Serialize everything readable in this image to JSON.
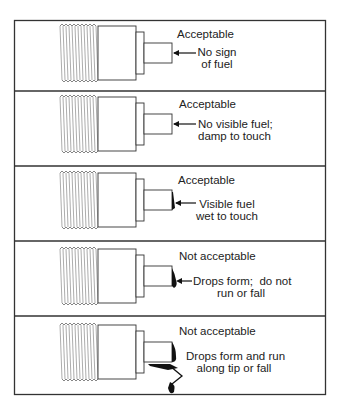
{
  "figure": {
    "panels": [
      {
        "status": "Acceptable",
        "description_lines": [
          "No sign",
          "of fuel"
        ],
        "fuel_state": "none"
      },
      {
        "status": "Acceptable",
        "description_lines": [
          "No visible fuel;",
          "damp to touch"
        ],
        "fuel_state": "damp"
      },
      {
        "status": "Acceptable",
        "description_lines": [
          "Visible fuel",
          "wet to touch"
        ],
        "fuel_state": "wet"
      },
      {
        "status": "Not acceptable",
        "description_lines": [
          "Drops form;  do not",
          "run or fall"
        ],
        "fuel_state": "drops"
      },
      {
        "status": "Not acceptable",
        "description_lines": [
          "Drops form and run",
          "along tip or fall"
        ],
        "fuel_state": "running"
      }
    ],
    "colors": {
      "line": "#333333",
      "fuel": "#111111",
      "thread": "#777777"
    }
  }
}
